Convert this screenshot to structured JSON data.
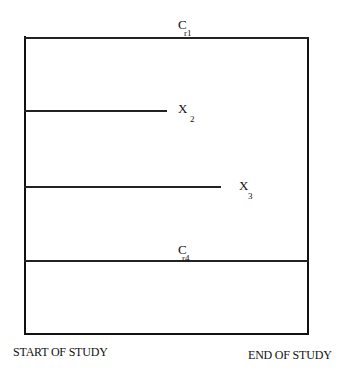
{
  "diagram": {
    "box": {
      "left": 25,
      "right": 308,
      "top": 37,
      "bottom": 334
    },
    "lines": [
      {
        "id": "cr1",
        "y": 37,
        "x_end": 308,
        "label": "C",
        "subscript": "r1",
        "label_x": 178,
        "label_y": 17,
        "sub_x": 185,
        "sub_y": 28,
        "label_position": "above"
      },
      {
        "id": "x2",
        "y": 111,
        "x_end": 167,
        "label": "X",
        "subscript": "2",
        "label_x": 178,
        "label_y": 102,
        "sub_x": 189,
        "sub_y": 114,
        "label_position": "right"
      },
      {
        "id": "x3",
        "y": 187,
        "x_end": 221,
        "label": "X",
        "subscript": "3",
        "label_x": 239,
        "label_y": 178,
        "sub_x": 248,
        "sub_y": 190,
        "label_position": "right"
      },
      {
        "id": "cr4",
        "y": 261,
        "x_end": 308,
        "label": "C",
        "subscript": "r4",
        "label_x": 178,
        "label_y": 243,
        "sub_x": 183,
        "sub_y": 254,
        "label_position": "above"
      }
    ],
    "axis_labels": {
      "start": "START OF STUDY",
      "end": "END OF STUDY"
    }
  }
}
